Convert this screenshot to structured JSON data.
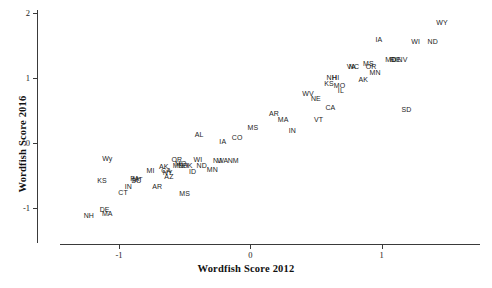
{
  "chart_data": {
    "type": "scatter",
    "title": "",
    "xlabel": "Wordfish Score 2012",
    "ylabel": "Wordfish Score 2016",
    "xlim": [
      -1.45,
      1.75
    ],
    "ylim": [
      -1.55,
      2.05
    ],
    "xticks": [
      -1,
      0,
      1
    ],
    "xticklabels": [
      "-1",
      "0",
      "1"
    ],
    "yticks": [
      -1,
      0,
      1,
      2
    ],
    "yticklabels": [
      "-1",
      "0",
      "1",
      "2"
    ],
    "grid": false,
    "legend": null,
    "marker": "text-label",
    "point_labels_are_markers": true,
    "points": [
      {
        "label": "WY",
        "x": 1.46,
        "y": 1.87
      },
      {
        "label": "IA",
        "x": 0.98,
        "y": 1.6
      },
      {
        "label": "WI",
        "x": 1.26,
        "y": 1.58
      },
      {
        "label": "ND",
        "x": 1.39,
        "y": 1.58
      },
      {
        "label": "MD",
        "x": 1.07,
        "y": 1.3
      },
      {
        "label": "RI",
        "x": 1.09,
        "y": 1.3
      },
      {
        "label": "DE",
        "x": 1.11,
        "y": 1.3
      },
      {
        "label": "NV",
        "x": 1.16,
        "y": 1.29
      },
      {
        "label": "VA",
        "x": 0.77,
        "y": 1.19
      },
      {
        "label": "NC",
        "x": 0.79,
        "y": 1.19
      },
      {
        "label": "MS",
        "x": 0.9,
        "y": 1.23
      },
      {
        "label": "OR",
        "x": 0.92,
        "y": 1.19
      },
      {
        "label": "MN",
        "x": 0.95,
        "y": 1.1
      },
      {
        "label": "AK",
        "x": 0.86,
        "y": 0.99
      },
      {
        "label": "NH",
        "x": 0.62,
        "y": 1.02
      },
      {
        "label": "HI",
        "x": 0.65,
        "y": 1.02
      },
      {
        "label": "KS",
        "x": 0.6,
        "y": 0.92
      },
      {
        "label": "MO",
        "x": 0.68,
        "y": 0.9
      },
      {
        "label": "IL",
        "x": 0.69,
        "y": 0.82
      },
      {
        "label": "WV",
        "x": 0.44,
        "y": 0.77
      },
      {
        "label": "NE",
        "x": 0.5,
        "y": 0.69
      },
      {
        "label": "CA",
        "x": 0.61,
        "y": 0.56
      },
      {
        "label": "SD",
        "x": 1.19,
        "y": 0.53
      },
      {
        "label": "AR",
        "x": 0.18,
        "y": 0.46
      },
      {
        "label": "MA",
        "x": 0.25,
        "y": 0.38
      },
      {
        "label": "VT",
        "x": 0.52,
        "y": 0.38
      },
      {
        "label": "MS",
        "x": 0.02,
        "y": 0.25
      },
      {
        "label": "IN",
        "x": 0.32,
        "y": 0.2
      },
      {
        "label": "CO",
        "x": -0.1,
        "y": 0.09
      },
      {
        "label": "AL",
        "x": -0.39,
        "y": 0.14
      },
      {
        "label": "IA",
        "x": -0.21,
        "y": 0.04
      },
      {
        "label": "Wy",
        "x": -1.09,
        "y": -0.22
      },
      {
        "label": "OR",
        "x": -0.56,
        "y": -0.24
      },
      {
        "label": "WI",
        "x": -0.4,
        "y": -0.24
      },
      {
        "label": "NJ",
        "x": -0.25,
        "y": -0.25
      },
      {
        "label": "WA",
        "x": -0.21,
        "y": -0.25
      },
      {
        "label": "NM",
        "x": -0.13,
        "y": -0.25
      },
      {
        "label": "ME",
        "x": -0.55,
        "y": -0.33
      },
      {
        "label": "MO",
        "x": -0.53,
        "y": -0.31
      },
      {
        "label": "NH",
        "x": -0.51,
        "y": -0.33
      },
      {
        "label": "OK",
        "x": -0.48,
        "y": -0.34
      },
      {
        "label": "ND",
        "x": -0.37,
        "y": -0.33
      },
      {
        "label": "MN",
        "x": -0.29,
        "y": -0.39
      },
      {
        "label": "ID",
        "x": -0.44,
        "y": -0.42
      },
      {
        "label": "MI",
        "x": -0.76,
        "y": -0.41
      },
      {
        "label": "AK",
        "x": -0.66,
        "y": -0.35
      },
      {
        "label": "CA",
        "x": -0.64,
        "y": -0.41
      },
      {
        "label": "NY",
        "x": -0.63,
        "y": -0.44
      },
      {
        "label": "AZ",
        "x": -0.62,
        "y": -0.5
      },
      {
        "label": "KS",
        "x": -1.13,
        "y": -0.56
      },
      {
        "label": "PA",
        "x": -0.88,
        "y": -0.54
      },
      {
        "label": "SC",
        "x": -0.87,
        "y": -0.57
      },
      {
        "label": "MT",
        "x": -0.86,
        "y": -0.55
      },
      {
        "label": "IN",
        "x": -0.93,
        "y": -0.66
      },
      {
        "label": "AR",
        "x": -0.71,
        "y": -0.66
      },
      {
        "label": "CT",
        "x": -0.97,
        "y": -0.75
      },
      {
        "label": "MS",
        "x": -0.5,
        "y": -0.77
      },
      {
        "label": "NH",
        "x": -1.23,
        "y": -1.1
      },
      {
        "label": "DE",
        "x": -1.11,
        "y": -1.01
      },
      {
        "label": "MA",
        "x": -1.09,
        "y": -1.08
      }
    ]
  },
  "axes": {
    "x_title": "Wordfish Score 2012",
    "y_title": "Wordfish Score 2016"
  }
}
